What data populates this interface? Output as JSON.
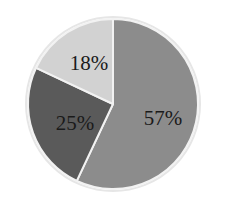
{
  "chart_data": {
    "type": "pie",
    "title": "",
    "categories": [
      "Slice A",
      "Slice B",
      "Slice C"
    ],
    "values": [
      57,
      25,
      18
    ],
    "labels": [
      "57%",
      "25%",
      "18%"
    ],
    "colors": [
      "#8c8c8c",
      "#5a5a5a",
      "#d2d2d2"
    ],
    "start_angle_deg": 0,
    "direction": "clockwise",
    "legend": "none",
    "label_position": "inside"
  },
  "style": {
    "slice_border_color": "#f2f2f2",
    "outer_ring_color": "#e6e6e6",
    "background": "#ffffff"
  }
}
